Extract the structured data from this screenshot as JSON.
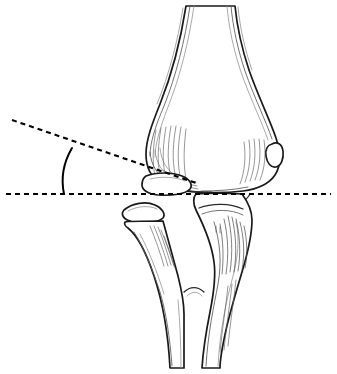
{
  "figure": {
    "title": "Lateral elbow bone tracing with angle measurement",
    "background_color": "#ffffff",
    "ink_color": "#1a1a1a",
    "shading_color": "#5e5e5e",
    "annotation_color": "#000000",
    "width": 337,
    "height": 374
  },
  "annotations": {
    "horizontal_reference": {
      "name": "horizontal reference line",
      "style": "dashed",
      "x1": 6,
      "y1": 194,
      "x2": 331,
      "y2": 194
    },
    "oblique_reference": {
      "name": "oblique reference line",
      "style": "dashed",
      "x1": 12,
      "y1": 120,
      "x2": 196,
      "y2": 183
    },
    "angle_arc": {
      "name": "angle arc between reference lines",
      "style": "solid curve",
      "vertex_x": 196,
      "vertex_y": 183,
      "start_x": 72,
      "start_y": 148,
      "end_x": 64,
      "end_y": 194
    }
  },
  "bones": [
    {
      "id": "humerus",
      "label": "distal humerus",
      "side": "proximal",
      "shading": "longitudinal hatching"
    },
    {
      "id": "lateral-ossicle",
      "label": "lateral ossicle",
      "side": "lateral",
      "shading": "outline only"
    },
    {
      "id": "upper-fragment",
      "label": "upper bone fragment",
      "side": "medial",
      "shading": "outline only"
    },
    {
      "id": "lower-fragment",
      "label": "lower bone fragment",
      "side": "medial",
      "shading": "outline only"
    },
    {
      "id": "radius",
      "label": "radius",
      "side": "lateral",
      "shading": "light hatching"
    },
    {
      "id": "ulna",
      "label": "ulna",
      "side": "medial",
      "shading": "dense hatching"
    }
  ]
}
